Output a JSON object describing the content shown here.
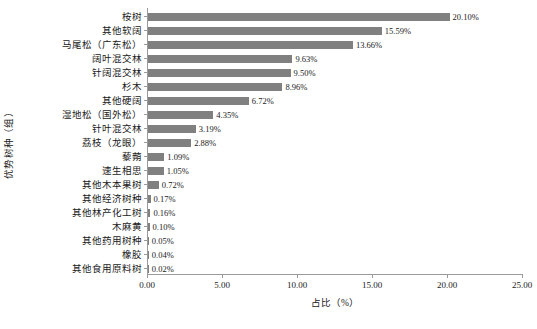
{
  "chart_data": {
    "type": "bar",
    "orientation": "horizontal",
    "title": "",
    "xlabel": "占比（%）",
    "ylabel": "优势树种（组）",
    "xlim": [
      0.0,
      25.0
    ],
    "xticks": [
      "0.00",
      "5.00",
      "10.00",
      "15.00",
      "20.00",
      "25.00"
    ],
    "xtick_values": [
      0,
      5,
      10,
      15,
      20,
      25
    ],
    "grid": false,
    "legend": null,
    "bar_color": "#808080",
    "axis_color": "#9a9a9a",
    "categories": [
      "桉树",
      "其他软阔",
      "马尾松（广东松）",
      "阔叶混交林",
      "针阔混交林",
      "杉木",
      "其他硬阔",
      "湿地松（国外松）",
      "针叶混交林",
      "荔枝（龙眼）",
      "藜蒴",
      "速生相思",
      "其他木本果树",
      "其他经济树种",
      "其他林产化工树",
      "木麻黄",
      "其他药用树种",
      "橡胶",
      "其他食用原料树"
    ],
    "values": [
      20.1,
      15.59,
      13.66,
      9.63,
      9.5,
      8.96,
      6.72,
      4.35,
      3.19,
      2.88,
      1.09,
      1.05,
      0.72,
      0.17,
      0.16,
      0.1,
      0.05,
      0.04,
      0.02
    ],
    "value_labels": [
      "20.10%",
      "15.59%",
      "13.66%",
      "9.63%",
      "9.50%",
      "8.96%",
      "6.72%",
      "4.35%",
      "3.19%",
      "2.88%",
      "1.09%",
      "1.05%",
      "0.72%",
      "0.17%",
      "0.16%",
      "0.10%",
      "0.05%",
      "0.04%",
      "0.02%"
    ]
  }
}
